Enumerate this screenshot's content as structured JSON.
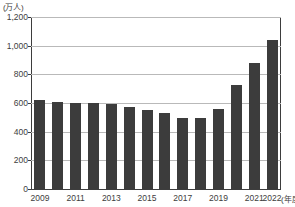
{
  "chart_data": {
    "type": "bar",
    "title": "",
    "subtitle": "",
    "xlabel": "(年度)",
    "ylabel": "(万人)",
    "yunit_label": "(万人)",
    "xunit_label": "(年度)",
    "grid": true,
    "legend": null,
    "ylim": [
      0,
      1200
    ],
    "ytick_labels": [
      "1,200",
      "1,000",
      "800",
      "600",
      "400",
      "200",
      "0"
    ],
    "ytick_values": [
      1200,
      1000,
      800,
      600,
      400,
      200,
      0
    ],
    "categories": [
      "2009",
      "2010",
      "2011",
      "2012",
      "2013",
      "2014",
      "2015",
      "2016",
      "2017",
      "2018",
      "2019",
      "2020",
      "2021",
      "2022"
    ],
    "xtick_labels_shown": [
      "2009",
      "2011",
      "2013",
      "2015",
      "2017",
      "2019",
      "2021",
      "2022"
    ],
    "values": [
      620,
      608,
      600,
      600,
      590,
      573,
      553,
      530,
      498,
      495,
      560,
      723,
      880,
      1043
    ],
    "bar_color": "#3c3c3c",
    "gridline_color": "#b9b9b9",
    "axis_color": "#3d3d3d",
    "series": [
      {
        "name": "",
        "values": [
          620,
          608,
          600,
          600,
          590,
          573,
          553,
          530,
          498,
          495,
          560,
          723,
          880,
          1043
        ]
      }
    ]
  }
}
